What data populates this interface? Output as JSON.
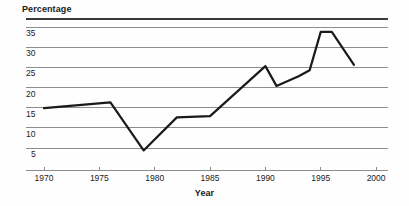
{
  "chart_data": {
    "type": "line",
    "title": "",
    "ylabel": "Percentage",
    "xlabel": "Year",
    "xlim": [
      1968,
      2001
    ],
    "ylim": [
      0,
      36
    ],
    "grid": true,
    "legend": false,
    "y_ticks": [
      35,
      30,
      25,
      20,
      15,
      10,
      5
    ],
    "x_ticks": [
      1970,
      1975,
      1980,
      1985,
      1990,
      1995,
      2000
    ],
    "series": [
      {
        "name": "Percentage",
        "color": "#1a1a1a",
        "x": [
          1970,
          1976,
          1979,
          1982,
          1985,
          1990,
          1991,
          1993,
          1994,
          1995,
          1996,
          1998
        ],
        "values": [
          14.9,
          16.3,
          4.4,
          12.6,
          12.9,
          25.3,
          20.4,
          22.8,
          24.3,
          33.8,
          33.8,
          25.6
        ]
      }
    ]
  },
  "colors": {
    "line": "#1a1a1a",
    "grid": "#8d8d8d",
    "top_border": "#3a3a3a",
    "axis": "#8d8d8d",
    "text": "#1a1a1a",
    "background": "#fefefe"
  },
  "labels": {
    "y_axis_title": "Percentage",
    "x_axis_title": "Year",
    "y_ticks": [
      "35",
      "30",
      "25",
      "20",
      "15",
      "10",
      "5"
    ],
    "x_ticks": [
      "1970",
      "1975",
      "1980",
      "1985",
      "1990",
      "1995",
      "2000"
    ]
  }
}
